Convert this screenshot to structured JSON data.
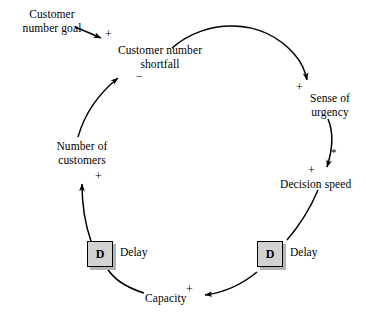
{
  "diagram": {
    "type": "causal-loop-diagram",
    "background_color": "#ffffff",
    "line_color": "#000000",
    "nodes": [
      {
        "id": "customer_number_goal",
        "label_line1": "Customer",
        "label_line2": "number goal",
        "x": 12,
        "y": 8
      },
      {
        "id": "customer_number_shortfall",
        "label_line1": "Customer number",
        "label_line2": "shortfall",
        "x": 112,
        "y": 44
      },
      {
        "id": "sense_of_urgency",
        "label_line1": "Sense of",
        "label_line2": "urgency",
        "x": 300,
        "y": 92
      },
      {
        "id": "decision_speed",
        "label_line1": "Decision speed",
        "label_line2": "",
        "x": 280,
        "y": 178
      },
      {
        "id": "capacity",
        "label_line1": "Capacity",
        "label_line2": "",
        "x": 145,
        "y": 292
      },
      {
        "id": "number_of_customers",
        "label_line1": "Number of",
        "label_line2": "customers",
        "x": 57,
        "y": 140
      }
    ],
    "delays": [
      {
        "id": "delay_left",
        "letter": "D",
        "label": "Delay",
        "x": 87,
        "y": 241
      },
      {
        "id": "delay_right",
        "letter": "D",
        "label": "Delay",
        "x": 257,
        "y": 241
      }
    ],
    "links": [
      {
        "id": "goal_to_shortfall",
        "from": "customer_number_goal",
        "to": "customer_number_shortfall",
        "polarity": "+"
      },
      {
        "id": "shortfall_to_urgency",
        "from": "customer_number_shortfall",
        "to": "sense_of_urgency",
        "polarity": "+"
      },
      {
        "id": "urgency_to_decision_speed",
        "from": "sense_of_urgency",
        "to": "decision_speed",
        "polarity": "+",
        "marker": "*"
      },
      {
        "id": "decision_speed_to_delay_right",
        "from": "decision_speed",
        "to": "delay_right",
        "polarity": ""
      },
      {
        "id": "delay_right_to_capacity",
        "from": "delay_right",
        "to": "capacity",
        "polarity": "+"
      },
      {
        "id": "capacity_to_delay_left",
        "from": "capacity",
        "to": "delay_left",
        "polarity": ""
      },
      {
        "id": "delay_left_to_customers",
        "from": "delay_left",
        "to": "number_of_customers",
        "polarity": "+"
      },
      {
        "id": "customers_to_shortfall",
        "from": "number_of_customers",
        "to": "customer_number_shortfall",
        "polarity": "−"
      }
    ],
    "polarity_markers": [
      {
        "id": "plus_goal_shortfall",
        "symbol": "+",
        "x": 105,
        "y": 28
      },
      {
        "id": "minus_customers_shortfall",
        "symbol": "−",
        "x": 136,
        "y": 72
      },
      {
        "id": "plus_shortfall_urgency",
        "symbol": "+",
        "x": 296,
        "y": 81
      },
      {
        "id": "star_urgency_decision",
        "symbol": "*",
        "x": 331,
        "y": 148
      },
      {
        "id": "plus_urgency_decision",
        "symbol": "+",
        "x": 308,
        "y": 166
      },
      {
        "id": "plus_delay_capacity",
        "symbol": "+",
        "x": 186,
        "y": 276
      },
      {
        "id": "plus_delay_customers",
        "symbol": "+",
        "x": 95,
        "y": 172
      }
    ]
  }
}
